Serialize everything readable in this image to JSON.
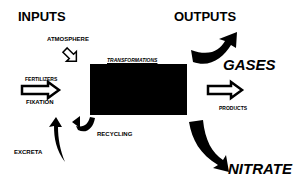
{
  "headings": {
    "inputs": "INPUTS",
    "outputs": "OUTPUTS"
  },
  "box": {
    "title": "TRANSFORMATIONS",
    "fill": "#000000"
  },
  "inputs": {
    "atmosphere": "ATMOSPHERE",
    "fertilizers": "FERTILIZERS",
    "fixation": "FIXATION",
    "excreta": "EXCRETA",
    "recycling": "RECYCLING"
  },
  "outputs": {
    "gases": "GASES",
    "products": "PRODUCTS",
    "nitrate": "NITRATE"
  }
}
